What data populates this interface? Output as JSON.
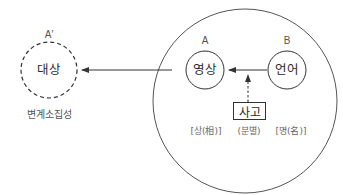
{
  "diagram": {
    "outer_node": {
      "letter": "A′",
      "label": "대상",
      "caption": "변계소집성",
      "style": "dashed"
    },
    "inner_nodes": [
      {
        "id": "A",
        "letter": "A",
        "label": "영상",
        "caption": "[상(相)]"
      },
      {
        "id": "B",
        "letter": "B",
        "label": "언어",
        "caption": "[명(名)]"
      }
    ],
    "middle_box": {
      "label": "사고",
      "caption": "(분별)"
    },
    "edges": [
      {
        "from": "영상",
        "to": "대상",
        "style": "solid"
      },
      {
        "from": "언어",
        "to": "영상",
        "style": "solid"
      },
      {
        "from": "사고",
        "to": "영상→언어 edge",
        "style": "dashed"
      }
    ],
    "colors": {
      "stroke": "#3a3a3a",
      "text": "#2b2b2b",
      "caption": "#666666"
    }
  }
}
